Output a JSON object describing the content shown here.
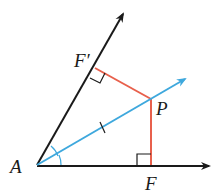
{
  "diagram": {
    "points": {
      "A": {
        "label": "A",
        "x": 37,
        "y": 165
      },
      "P": {
        "label": "P",
        "x": 151,
        "y": 99
      },
      "F": {
        "label": "F",
        "x": 151,
        "y": 166
      },
      "F_prime": {
        "label": "F′",
        "x": 95,
        "y": 68
      }
    },
    "rays": [
      {
        "name": "upper-side",
        "from": "A",
        "to": [
          124,
          12
        ],
        "color": "#1a1a1a"
      },
      {
        "name": "lower-side",
        "from": "A",
        "to": [
          211,
          166
        ],
        "color": "#1a1a1a"
      },
      {
        "name": "bisector",
        "from": "A",
        "to": [
          187,
          78
        ],
        "color": "#3ea8dd"
      }
    ],
    "segments": [
      {
        "name": "PF",
        "color": "#e8604c"
      },
      {
        "name": "PF_prime",
        "color": "#e8604c"
      }
    ],
    "labels": {
      "A": "A",
      "P": "P",
      "F": "F",
      "F_prime": "F′"
    },
    "colors": {
      "sides": "#1a1a1a",
      "bisector": "#3ea8dd",
      "perpendiculars": "#e8604c"
    }
  }
}
